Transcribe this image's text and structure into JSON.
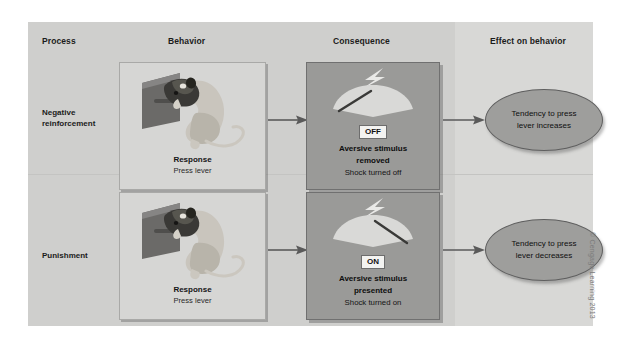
{
  "figure": {
    "colors": {
      "panel_background": "#cfcfcd",
      "panel_right_column": "#d8d8d6",
      "behavior_box": "#d6d6d4",
      "consequence_box": "#9a9a98",
      "effect_oval": "#9e9e9c",
      "chip_background": "#f3f3f1",
      "text": "#1b1b1b",
      "arrow": "#5a5a5a"
    }
  },
  "headers": {
    "process": "Process",
    "behavior": "Behavior",
    "consequence": "Consequence",
    "effect": "Effect on behavior"
  },
  "rows": [
    {
      "process_label": "Negative\nreinforcement",
      "process_line1": "Negative",
      "process_line2": "reinforcement",
      "behavior": {
        "image_alt": "rat pressing lever in operant chamber",
        "title": "Response",
        "subtitle": "Press lever"
      },
      "consequence": {
        "meter_state": "OFF",
        "needle_side": "left",
        "title_line1": "Aversive stimulus",
        "title_line2": "removed",
        "subtitle": "Shock turned off"
      },
      "effect": {
        "line1": "Tendency to press",
        "line2": "lever increases"
      }
    },
    {
      "process_label": "Punishment",
      "process_line1": "Punishment",
      "process_line2": "",
      "behavior": {
        "image_alt": "rat pressing lever in operant chamber",
        "title": "Response",
        "subtitle": "Press lever"
      },
      "consequence": {
        "meter_state": "ON",
        "needle_side": "right",
        "title_line1": "Aversive stimulus",
        "title_line2": "presented",
        "subtitle": "Shock turned on"
      },
      "effect": {
        "line1": "Tendency to press",
        "line2": "lever decreases"
      }
    }
  ],
  "credit": "© Cengage Learning 2013"
}
